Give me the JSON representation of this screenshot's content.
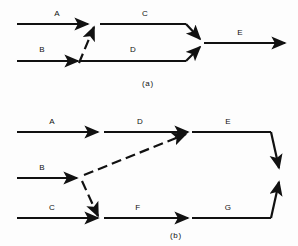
{
  "figure": {
    "background_color": "#fdfdfd",
    "stroke_color": "#111111",
    "label_color": "#111111",
    "panels": [
      {
        "id": "panel-a",
        "caption": "(a)",
        "caption_x": 148,
        "caption_y": 86,
        "edges": [
          {
            "name": "edge-a",
            "label": "A",
            "label_x": 57,
            "label_y": 16,
            "style": "solid",
            "arrow": true,
            "path": "M 17 24 L 88 24"
          },
          {
            "name": "edge-b",
            "label": "B",
            "label_x": 42,
            "label_y": 52,
            "style": "solid",
            "arrow": true,
            "path": "M 17 61 L 78 61"
          },
          {
            "name": "edge-b-to-a-dashed",
            "label": "",
            "style": "dashed",
            "arrow": true,
            "path": "M 79 63 L 94 27"
          },
          {
            "name": "edge-c",
            "label": "C",
            "label_x": 145,
            "label_y": 16,
            "style": "solid",
            "arrow": false,
            "path": "M 100 24 L 186 24"
          },
          {
            "name": "edge-c-merge",
            "label": "",
            "style": "solid",
            "arrow": true,
            "path": "M 186 24 L 200 39"
          },
          {
            "name": "edge-d",
            "label": "D",
            "label_x": 133,
            "label_y": 52,
            "style": "solid",
            "arrow": false,
            "path": "M 79 61 L 186 61"
          },
          {
            "name": "edge-d-merge",
            "label": "",
            "style": "solid",
            "arrow": true,
            "path": "M 186 61 L 200 47"
          },
          {
            "name": "edge-e",
            "label": "E",
            "label_x": 240,
            "label_y": 35,
            "style": "solid",
            "arrow": true,
            "path": "M 204 43 L 285 43"
          }
        ]
      },
      {
        "id": "panel-b",
        "caption": "(b)",
        "caption_x": 176,
        "caption_y": 238,
        "edges": [
          {
            "name": "edge-a",
            "label": "A",
            "label_x": 52,
            "label_y": 124,
            "style": "solid",
            "arrow": true,
            "path": "M 17 132 L 98 132"
          },
          {
            "name": "edge-d",
            "label": "D",
            "label_x": 140,
            "label_y": 124,
            "style": "solid",
            "arrow": true,
            "path": "M 104 132 L 188 132"
          },
          {
            "name": "edge-b",
            "label": "B",
            "label_x": 42,
            "label_y": 170,
            "style": "solid",
            "arrow": true,
            "path": "M 17 178 L 77 178"
          },
          {
            "name": "edge-b-to-d-dashed",
            "label": "",
            "style": "dashed",
            "arrow": true,
            "path": "M 84 175 L 186 134"
          },
          {
            "name": "edge-b-to-c-dashed",
            "label": "",
            "style": "dashed",
            "arrow": true,
            "path": "M 82 181 L 98 216"
          },
          {
            "name": "edge-c",
            "label": "C",
            "label_x": 52,
            "label_y": 210,
            "style": "solid",
            "arrow": true,
            "path": "M 17 218 L 98 218"
          },
          {
            "name": "edge-f",
            "label": "F",
            "label_x": 138,
            "label_y": 210,
            "style": "solid",
            "arrow": true,
            "path": "M 104 218 L 188 218"
          },
          {
            "name": "edge-e",
            "label": "E",
            "label_x": 228,
            "label_y": 124,
            "style": "solid",
            "arrow": false,
            "path": "M 192 132 L 271 132"
          },
          {
            "name": "edge-e-merge",
            "label": "",
            "style": "solid",
            "arrow": true,
            "path": "M 271 132 L 279 168"
          },
          {
            "name": "edge-g",
            "label": "G",
            "label_x": 228,
            "label_y": 210,
            "style": "solid",
            "arrow": false,
            "path": "M 192 218 L 271 218"
          },
          {
            "name": "edge-g-merge",
            "label": "",
            "style": "solid",
            "arrow": true,
            "path": "M 271 218 L 279 182"
          }
        ]
      }
    ]
  }
}
